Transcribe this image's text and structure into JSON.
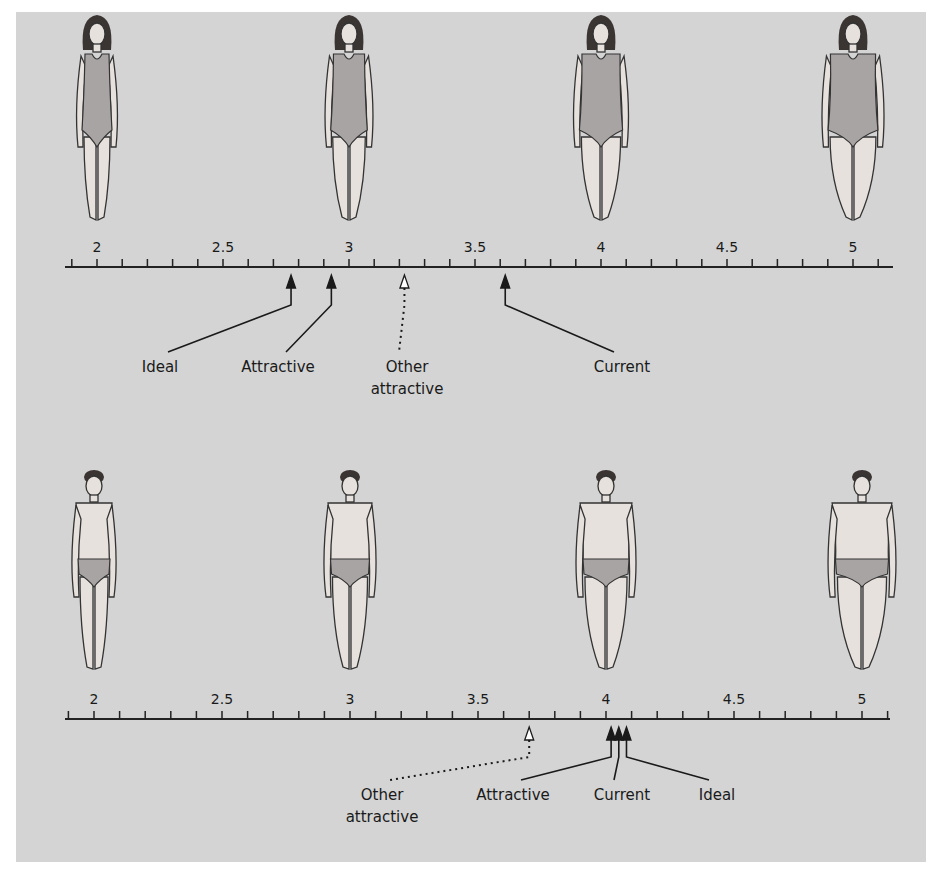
{
  "figure": {
    "background_color": "#d4d4d4",
    "panels": [
      {
        "id": "female",
        "scale": {
          "min": 1.8,
          "max": 5.15,
          "tick_step": 0.1,
          "labels": [
            "2",
            "2.5",
            "3",
            "3.5",
            "4",
            "4.5",
            "5"
          ],
          "label_values": [
            2,
            2.5,
            3,
            3.5,
            4,
            4.5,
            5
          ],
          "px_x0": 97,
          "px_per_unit": 252,
          "axis_y": 267,
          "axis_x_start": 65,
          "axis_x_end": 893
        },
        "figure_values": [
          2,
          3,
          4,
          5
        ],
        "figure_type": "female",
        "markers": [
          {
            "label_lines": [
              "Ideal"
            ],
            "value": 2.77,
            "style": "solid",
            "label_x": 160,
            "label_y": 372
          },
          {
            "label_lines": [
              "Attractive"
            ],
            "value": 2.93,
            "style": "solid",
            "label_x": 278,
            "label_y": 372
          },
          {
            "label_lines": [
              "Other",
              "attractive"
            ],
            "value": 3.22,
            "style": "dotted-hollow",
            "label_x": 407,
            "label_y": 372
          },
          {
            "label_lines": [
              "Current"
            ],
            "value": 3.62,
            "style": "solid",
            "label_x": 622,
            "label_y": 372
          }
        ]
      },
      {
        "id": "male",
        "scale": {
          "min": 1.8,
          "max": 5.15,
          "tick_step": 0.1,
          "labels": [
            "2",
            "2.5",
            "3",
            "3.5",
            "4",
            "4.5",
            "5"
          ],
          "label_values": [
            2,
            2.5,
            3,
            3.5,
            4,
            4.5,
            5
          ],
          "px_x0": 94,
          "px_per_unit": 256,
          "axis_y": 719,
          "axis_x_start": 65,
          "axis_x_end": 890
        },
        "figure_values": [
          2,
          3,
          4,
          5
        ],
        "figure_type": "male",
        "markers": [
          {
            "label_lines": [
              "Other",
              "attractive"
            ],
            "value": 3.7,
            "style": "dotted-hollow",
            "label_x": 382,
            "label_y": 800
          },
          {
            "label_lines": [
              "Attractive"
            ],
            "value": 4.02,
            "style": "solid",
            "label_x": 513,
            "label_y": 800
          },
          {
            "label_lines": [
              "Current"
            ],
            "value": 4.05,
            "style": "solid",
            "label_x": 622,
            "label_y": 800
          },
          {
            "label_lines": [
              "Ideal"
            ],
            "value": 4.08,
            "style": "solid",
            "label_x": 717,
            "label_y": 800
          }
        ]
      }
    ]
  },
  "chart_data": {
    "type": "scatter",
    "title": "",
    "xlabel": "Body-figure rating",
    "ylabel": "",
    "x_ticks": [
      2,
      2.5,
      3,
      3.5,
      4,
      4.5,
      5
    ],
    "xlim": [
      1.8,
      5.15
    ],
    "series": [
      {
        "name": "Women",
        "points": [
          {
            "label": "Ideal",
            "x": 2.77
          },
          {
            "label": "Attractive",
            "x": 2.93
          },
          {
            "label": "Other attractive",
            "x": 3.22
          },
          {
            "label": "Current",
            "x": 3.62
          }
        ]
      },
      {
        "name": "Men",
        "points": [
          {
            "label": "Other attractive",
            "x": 3.7
          },
          {
            "label": "Attractive",
            "x": 4.02
          },
          {
            "label": "Current",
            "x": 4.05
          },
          {
            "label": "Ideal",
            "x": 4.08
          }
        ]
      }
    ]
  }
}
